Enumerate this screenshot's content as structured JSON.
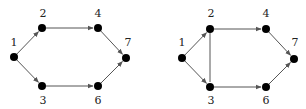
{
  "graphs": [
    {
      "name": "graph-left",
      "nodes": [
        {
          "id": "1",
          "label": "1",
          "x": 14,
          "y": 57,
          "lx": 14,
          "ly": 46
        },
        {
          "id": "2",
          "label": "2",
          "x": 42,
          "y": 28,
          "lx": 43,
          "ly": 17
        },
        {
          "id": "4",
          "label": "4",
          "x": 98,
          "y": 28,
          "lx": 98,
          "ly": 17
        },
        {
          "id": "7",
          "label": "7",
          "x": 126,
          "y": 58,
          "lx": 128,
          "ly": 46
        },
        {
          "id": "3",
          "label": "3",
          "x": 42,
          "y": 86,
          "lx": 43,
          "ly": 104
        },
        {
          "id": "6",
          "label": "6",
          "x": 98,
          "y": 86,
          "lx": 98,
          "ly": 104
        }
      ],
      "edges": [
        {
          "from": "1",
          "to": "2",
          "directed": true
        },
        {
          "from": "1",
          "to": "3",
          "directed": true
        },
        {
          "from": "2",
          "to": "4",
          "directed": true
        },
        {
          "from": "3",
          "to": "6",
          "directed": true
        },
        {
          "from": "4",
          "to": "7",
          "directed": true
        },
        {
          "from": "6",
          "to": "7",
          "directed": true
        }
      ]
    },
    {
      "name": "graph-right",
      "nodes": [
        {
          "id": "1",
          "label": "1",
          "x": 182,
          "y": 58,
          "lx": 182,
          "ly": 46
        },
        {
          "id": "2",
          "label": "2",
          "x": 210,
          "y": 29,
          "lx": 211,
          "ly": 17
        },
        {
          "id": "4",
          "label": "4",
          "x": 266,
          "y": 29,
          "lx": 266,
          "ly": 17
        },
        {
          "id": "7",
          "label": "7",
          "x": 294,
          "y": 59,
          "lx": 295,
          "ly": 46
        },
        {
          "id": "3",
          "label": "3",
          "x": 210,
          "y": 87,
          "lx": 211,
          "ly": 104
        },
        {
          "id": "6",
          "label": "6",
          "x": 266,
          "y": 87,
          "lx": 266,
          "ly": 104
        }
      ],
      "edges": [
        {
          "from": "1",
          "to": "2",
          "directed": true
        },
        {
          "from": "1",
          "to": "3",
          "directed": true
        },
        {
          "from": "2",
          "to": "3",
          "directed": false
        },
        {
          "from": "2",
          "to": "4",
          "directed": true
        },
        {
          "from": "3",
          "to": "6",
          "directed": true
        },
        {
          "from": "4",
          "to": "7",
          "directed": true
        },
        {
          "from": "6",
          "to": "7",
          "directed": true
        }
      ]
    }
  ],
  "style": {
    "edge_color": "#555555",
    "node_color": "#000000",
    "node_radius": 4
  }
}
